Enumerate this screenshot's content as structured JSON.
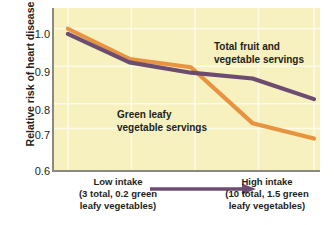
{
  "chart_data": {
    "type": "line",
    "title": "",
    "subtitle": "",
    "xlabel": "",
    "ylabel": "Relative risk of heart disease",
    "ylim": [
      0.6,
      1.0
    ],
    "yticks": [
      "1.0",
      "0.9",
      "0.8",
      "0.7",
      "0.6"
    ],
    "ytick_values": [
      1.0,
      0.9,
      0.8,
      0.7,
      0.6
    ],
    "xlim": [
      0,
      4
    ],
    "xticks": [],
    "grid": "both-light-white",
    "legend_position": "inline-annotations",
    "x": [
      0,
      1,
      2,
      3,
      4
    ],
    "series": [
      {
        "name": "Total fruit and vegetable servings",
        "color": "#6d4c72",
        "values": [
          0.985,
          0.902,
          0.872,
          0.855,
          0.795
        ]
      },
      {
        "name": "Green leafy vegetable servings",
        "color": "#e8933f",
        "values": [
          1.0,
          0.912,
          0.888,
          0.725,
          0.68
        ]
      }
    ],
    "annotations": [
      {
        "name": "total-fruit-label",
        "text": "Total fruit and\nvegetable servings"
      },
      {
        "name": "green-leafy-label",
        "text": "Green leafy\nvegetable servings"
      }
    ],
    "x_axis_caption": {
      "low": "Low intake\n(3 total, 0.2 green\nleafy vegetables)",
      "high": "High intake\n(10 total, 1.5 green\nleafy vegetables)",
      "arrow_color": "#6d4c72",
      "arrow_direction": "left-to-right"
    },
    "colors": {
      "plot_background": "#f7f0bf",
      "page_background": "#ffffff",
      "axis_line": "#8a8a84",
      "gridline": "#fdfbe6",
      "text": "#231f20",
      "purple_series": "#6d4c72",
      "orange_series": "#e8933f"
    }
  }
}
